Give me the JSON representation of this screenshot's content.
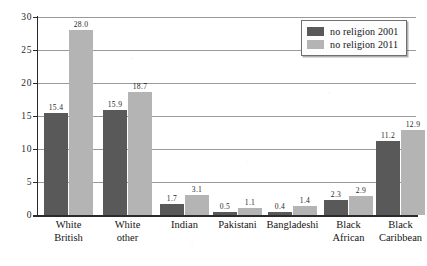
{
  "chart_data": {
    "type": "bar",
    "title": "",
    "subtitle": "",
    "xlabel": "",
    "ylabel": "",
    "ylim": [
      0,
      30
    ],
    "ytick_values": [
      0,
      5,
      10,
      15,
      20,
      25,
      30
    ],
    "ytick_labels": [
      "0",
      "5",
      "10",
      "15",
      "20",
      "25",
      "30"
    ],
    "grid": true,
    "legend_position": "top-right",
    "categories": [
      "White British",
      "White other",
      "Indian",
      "Pakistani",
      "Bangladeshi",
      "Black African",
      "Black Caribbean"
    ],
    "category_lines": [
      [
        "White",
        "British"
      ],
      [
        "White",
        "other"
      ],
      [
        "Indian",
        ""
      ],
      [
        "Pakistani",
        ""
      ],
      [
        "Bangladeshi",
        ""
      ],
      [
        "Black",
        "African"
      ],
      [
        "Black",
        "Caribbean"
      ]
    ],
    "series": [
      {
        "name": "no religion 2001",
        "color": "#595959",
        "values": [
          15.4,
          15.9,
          1.7,
          0.5,
          0.4,
          2.3,
          11.2
        ],
        "labels": [
          "15.4",
          "15.9",
          "1.7",
          "0.5",
          "0.4",
          "2.3",
          "11.2"
        ]
      },
      {
        "name": "no religion 2011",
        "color": "#b4b4b4",
        "values": [
          28.0,
          18.7,
          3.1,
          1.1,
          1.4,
          2.9,
          12.9
        ],
        "labels": [
          "28.0",
          "18.7",
          "3.1",
          "1.1",
          "1.4",
          "2.9",
          "12.9"
        ]
      }
    ]
  },
  "legend": {
    "items": [
      {
        "label": "no religion 2001",
        "color": "#595959"
      },
      {
        "label": "no religion 2011",
        "color": "#b4b4b4"
      }
    ]
  },
  "colors": {
    "series_2001": "#595959",
    "series_2011": "#b4b4b4",
    "axis": "#2b2b2b",
    "gridline": "#9a9a9a",
    "background": "#ffffff"
  }
}
